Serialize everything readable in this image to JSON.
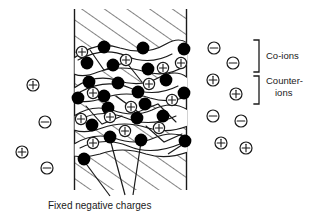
{
  "figure": {
    "caption": "Fixed negative charges",
    "legend": [
      {
        "id": "co-ions",
        "label": "Co-ions",
        "lines": [
          "Co-ions"
        ]
      },
      {
        "id": "counter-ions",
        "label": "Counter-ions",
        "lines": [
          "Counter-",
          "ions"
        ]
      }
    ],
    "symbols": {
      "positive": "+",
      "negative": "−",
      "fixed_charge_name": "filled-black-circle"
    },
    "colors": {
      "ink": "#1a1a1a",
      "background": "#ffffff",
      "fixed_charge_fill": "#000000",
      "mobile_ion_fill": "#ffffff"
    },
    "membrane": {
      "name": "ion-exchange-membrane",
      "left_edge_x": 74,
      "right_edge_x": 187,
      "top_y": 9,
      "bottom_y": 190,
      "hatch_angle_deg": 55
    },
    "solution_left": {
      "name": "left-solution-region",
      "ions": [
        {
          "charge": "+",
          "x": 33,
          "y": 85
        },
        {
          "charge": "-",
          "x": 45,
          "y": 122
        },
        {
          "charge": "+",
          "x": 22,
          "y": 152
        },
        {
          "charge": "-",
          "x": 47,
          "y": 168
        }
      ]
    },
    "solution_right": {
      "name": "right-solution-region",
      "ions": [
        {
          "charge": "-",
          "x": 214,
          "y": 48
        },
        {
          "charge": "-",
          "x": 233,
          "y": 63
        },
        {
          "charge": "+",
          "x": 213,
          "y": 80
        },
        {
          "charge": "+",
          "x": 236,
          "y": 94
        },
        {
          "charge": "-",
          "x": 213,
          "y": 116
        },
        {
          "charge": "-",
          "x": 241,
          "y": 121
        },
        {
          "charge": "+",
          "x": 221,
          "y": 143
        },
        {
          "charge": "+",
          "x": 246,
          "y": 148
        }
      ]
    },
    "membrane_counterions": [
      {
        "charge": "+",
        "x": 82,
        "y": 52
      },
      {
        "charge": "+",
        "x": 126,
        "y": 60
      },
      {
        "charge": "+",
        "x": 163,
        "y": 68
      },
      {
        "charge": "+",
        "x": 181,
        "y": 63
      },
      {
        "charge": "+",
        "x": 93,
        "y": 93
      },
      {
        "charge": "+",
        "x": 149,
        "y": 84
      },
      {
        "charge": "+",
        "x": 172,
        "y": 100
      },
      {
        "charge": "+",
        "x": 131,
        "y": 107
      },
      {
        "charge": "+",
        "x": 81,
        "y": 119
      },
      {
        "charge": "+",
        "x": 110,
        "y": 117
      },
      {
        "charge": "+",
        "x": 125,
        "y": 131
      },
      {
        "charge": "+",
        "x": 159,
        "y": 128
      },
      {
        "charge": "+",
        "x": 93,
        "y": 143
      },
      {
        "charge": "+",
        "x": 96,
        "y": 124
      }
    ],
    "fixed_charges": [
      {
        "x": 104,
        "y": 47
      },
      {
        "x": 143,
        "y": 48
      },
      {
        "x": 184,
        "y": 49
      },
      {
        "x": 87,
        "y": 63
      },
      {
        "x": 113,
        "y": 65
      },
      {
        "x": 148,
        "y": 69
      },
      {
        "x": 89,
        "y": 82
      },
      {
        "x": 118,
        "y": 83
      },
      {
        "x": 166,
        "y": 80
      },
      {
        "x": 78,
        "y": 98
      },
      {
        "x": 104,
        "y": 96
      },
      {
        "x": 138,
        "y": 92
      },
      {
        "x": 184,
        "y": 93
      },
      {
        "x": 108,
        "y": 108
      },
      {
        "x": 145,
        "y": 104
      },
      {
        "x": 92,
        "y": 125
      },
      {
        "x": 137,
        "y": 118
      },
      {
        "x": 163,
        "y": 116
      },
      {
        "x": 110,
        "y": 137
      },
      {
        "x": 141,
        "y": 140
      },
      {
        "x": 185,
        "y": 141
      },
      {
        "x": 84,
        "y": 159
      }
    ],
    "leader_lines": [
      {
        "from_x": 84,
        "from_y": 159,
        "to_x": 110,
        "to_y": 196
      },
      {
        "from_x": 110,
        "from_y": 137,
        "to_x": 125,
        "to_y": 194
      },
      {
        "from_x": 141,
        "from_y": 140,
        "to_x": 133,
        "to_y": 194
      },
      {
        "from_x": 185,
        "from_y": 141,
        "to_x": 171,
        "to_y": 152
      }
    ]
  }
}
